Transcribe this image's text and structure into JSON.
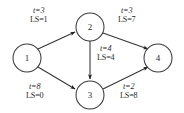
{
  "diagram": {
    "type": "directed-activity-network",
    "background_color": "#ffffff",
    "line_color": "#333333",
    "text_color": "#2b2b2b",
    "nodes": [
      {
        "id": "1",
        "label": "1",
        "cx": 27,
        "cy": 58,
        "r": 14
      },
      {
        "id": "2",
        "label": "2",
        "cx": 90,
        "cy": 27,
        "r": 14
      },
      {
        "id": "3",
        "label": "3",
        "cx": 90,
        "cy": 95,
        "r": 14
      },
      {
        "id": "4",
        "label": "4",
        "cx": 158,
        "cy": 58,
        "r": 14
      }
    ],
    "edges": [
      {
        "id": "e-1-2",
        "from": "1",
        "to": "2",
        "t_label": "t=3",
        "ls_label": "LS=1",
        "label_x": 30,
        "label_y": 7
      },
      {
        "id": "e-2-4",
        "from": "2",
        "to": "4",
        "t_label": "t=3",
        "ls_label": "LS=7",
        "label_x": 118,
        "label_y": 7
      },
      {
        "id": "e-2-3",
        "from": "2",
        "to": "3",
        "t_label": "t=4",
        "ls_label": "LS=4",
        "label_x": 97,
        "label_y": 45
      },
      {
        "id": "e-1-3",
        "from": "1",
        "to": "3",
        "t_label": "t=8",
        "ls_label": "LS=0",
        "label_x": 26,
        "label_y": 83
      },
      {
        "id": "e-3-4",
        "from": "3",
        "to": "4",
        "t_label": "t=2",
        "ls_label": "LS=8",
        "label_x": 120,
        "label_y": 83
      }
    ]
  }
}
